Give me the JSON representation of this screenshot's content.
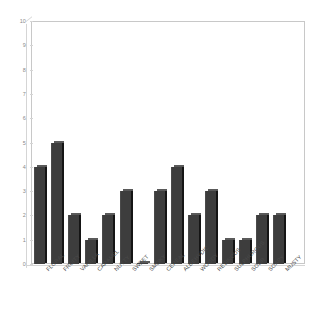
{
  "chart_data": {
    "type": "bar",
    "title": "",
    "subtitle": "",
    "xlabel": "",
    "ylabel": "",
    "ylim": [
      0,
      10
    ],
    "yticks": [
      0,
      1,
      2,
      3,
      4,
      5,
      6,
      7,
      8,
      9,
      10
    ],
    "grid": false,
    "legend": null,
    "bar_color": "#3d3d3d",
    "categories": [
      "FLORAL",
      "FRUITY",
      "VANILLA",
      "CARAMEL",
      "NUTTY",
      "SWEET",
      "SMOKY",
      "CEREAL",
      "ALDEHYDIC",
      "WOODY",
      "RESINOUS",
      "SULPHUROUS",
      "SOUR",
      "SOAPY",
      "MUSTY"
    ],
    "values": [
      4,
      5,
      2,
      1,
      2,
      3,
      0,
      3,
      4,
      2,
      3,
      1,
      1,
      2,
      2
    ]
  }
}
